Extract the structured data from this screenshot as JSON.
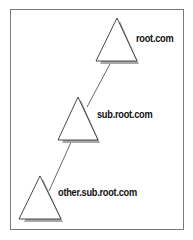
{
  "diagram": {
    "type": "domain-tree",
    "nodes": [
      {
        "id": "root",
        "label": "root.com"
      },
      {
        "id": "sub",
        "label": "sub.root.com"
      },
      {
        "id": "other",
        "label": "other.sub.root.com"
      }
    ],
    "edges": [
      {
        "from": "root",
        "to": "sub"
      },
      {
        "from": "sub",
        "to": "other"
      }
    ],
    "colors": {
      "stroke": "#333333",
      "shadow": "#9a9a9a",
      "frame": "#7a7a7a"
    }
  }
}
